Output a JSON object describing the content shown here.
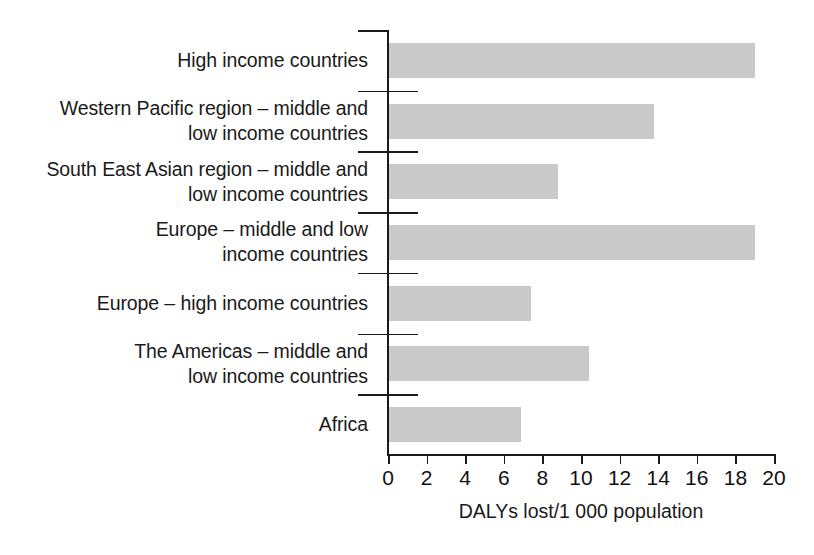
{
  "chart_data": {
    "type": "bar",
    "orientation": "horizontal",
    "title": "",
    "subtitle": "",
    "xlabel": "DALYs lost/1 000 population",
    "ylabel": "",
    "xlim": [
      0,
      20
    ],
    "xticks": [
      0,
      2,
      4,
      6,
      8,
      10,
      12,
      14,
      16,
      18,
      20
    ],
    "xtick_labels": [
      "0",
      "2",
      "4",
      "6",
      "8",
      "10",
      "12",
      "14",
      "16",
      "18",
      "20"
    ],
    "grid": false,
    "legend": null,
    "bar_color": "#c9c9c9",
    "axis_color": "#1a1a1a",
    "categories": [
      "High income countries",
      "Western Pacific region – middle and\nlow income countries",
      "South East Asian region – middle and\nlow income countries",
      "Europe – middle and low\nincome countries",
      "Europe – high income countries",
      "The Americas – middle and\nlow income countries",
      "Africa"
    ],
    "values": [
      19.0,
      13.8,
      8.8,
      19.0,
      7.4,
      10.4,
      6.9
    ]
  },
  "axis": {
    "x_title": "DALYs lost/1 000 population"
  }
}
